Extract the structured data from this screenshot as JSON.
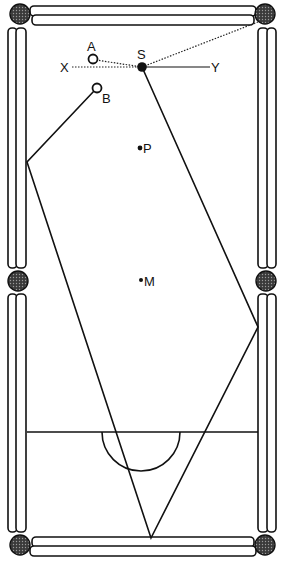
{
  "diagram": {
    "type": "billiards-table-shot-diagram",
    "background_color": "#ffffff",
    "ink_color": "#111111",
    "labels": {
      "A": "A",
      "B": "B",
      "S": "S",
      "X": "X",
      "Y": "Y",
      "P": "P",
      "M": "M"
    },
    "balls": [
      {
        "id": "A",
        "label": "A",
        "fill": "open"
      },
      {
        "id": "B",
        "label": "B",
        "fill": "open"
      },
      {
        "id": "S",
        "label": "S",
        "fill": "solid"
      }
    ],
    "spots": [
      {
        "id": "P",
        "label": "P"
      },
      {
        "id": "M",
        "label": "M"
      }
    ],
    "pockets": [
      "top-left",
      "top-right",
      "middle-left",
      "middle-right",
      "bottom-left",
      "bottom-right"
    ],
    "lines": [
      {
        "id": "XY",
        "from": "X",
        "to": "Y",
        "style": "dotted-to-solid"
      },
      {
        "id": "A-S",
        "from": "A",
        "to": "S",
        "style": "dotted"
      },
      {
        "id": "S-top-right-pocket",
        "from": "S",
        "to": "top-right pocket",
        "style": "dotted"
      },
      {
        "id": "B-path",
        "from": "B",
        "via": [
          "left cushion",
          "bottom cushion",
          "right cushion"
        ],
        "to": "S",
        "style": "solid"
      }
    ],
    "baulk_line": true,
    "d_semicircle": true
  }
}
